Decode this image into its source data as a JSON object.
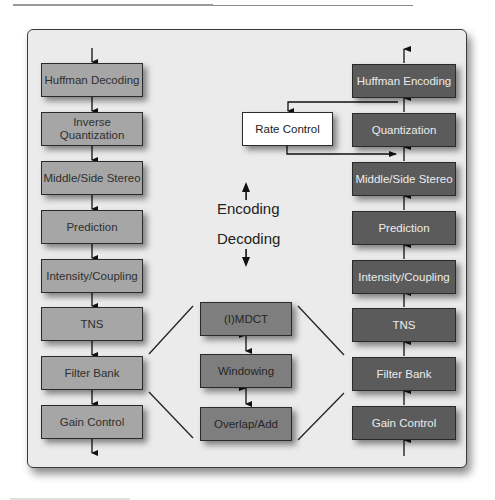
{
  "diagram": {
    "decoder_column": [
      {
        "label": "Huffman Decoding"
      },
      {
        "label": "Inverse Quantization"
      },
      {
        "label": "Middle/Side Stereo"
      },
      {
        "label": "Prediction"
      },
      {
        "label": "Intensity/Coupling"
      },
      {
        "label": "TNS"
      },
      {
        "label": "Filter Bank"
      },
      {
        "label": "Gain Control"
      }
    ],
    "encoder_column": [
      {
        "label": "Huffman Encoding"
      },
      {
        "label": "Quantization"
      },
      {
        "label": "Middle/Side Stereo"
      },
      {
        "label": "Prediction"
      },
      {
        "label": "Intensity/Coupling"
      },
      {
        "label": "TNS"
      },
      {
        "label": "Filter Bank"
      },
      {
        "label": "Gain Control"
      }
    ],
    "filter_bank_detail": [
      {
        "label": "(I)MDCT"
      },
      {
        "label": "Windowing"
      },
      {
        "label": "Overlap/Add"
      }
    ],
    "rate_control": {
      "label": "Rate Control"
    },
    "direction_labels": {
      "encoding": "Encoding",
      "decoding": "Decoding"
    },
    "colors": {
      "decoder_box": "#a6a6a6",
      "encoder_box": "#5b5b5b",
      "detail_box": "#7e7e7e",
      "rate_control_box": "#ffffff",
      "panel": "#ebebeb"
    }
  }
}
